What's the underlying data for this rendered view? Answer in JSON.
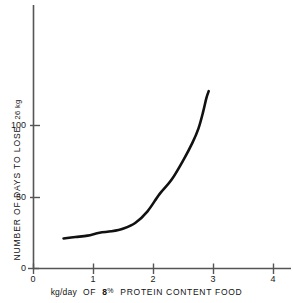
{
  "chart_data": {
    "type": "line",
    "title": "",
    "xlabel": "kg/day OF 8 % PROTEIN CONTENT FOOD",
    "ylabel": "NUMBER OF DAYS TO LOSE 26 kg",
    "xlabel_parts": {
      "lead": "kg/day",
      "mid": "OF",
      "value": "8",
      "percent": "%",
      "tail": "PROTEIN CONTENT FOOD"
    },
    "ylabel_parts": {
      "main": "NUMBER OF DAYS TO LOSE",
      "unit": "26 kg"
    },
    "xlim": [
      0,
      4.3
    ],
    "ylim": [
      0,
      145
    ],
    "xticks": [
      0,
      1,
      2,
      3,
      4
    ],
    "xtick_labels": [
      "0",
      "1",
      "2",
      "3",
      "4"
    ],
    "yticks": [
      0,
      50,
      100
    ],
    "ytick_labels": [
      "0",
      "50",
      "100"
    ],
    "grid": false,
    "legend": null,
    "series": [
      {
        "name": "days to lose 26 kg",
        "color": "#111111",
        "x": [
          0.5,
          0.7,
          0.9,
          1.1,
          1.3,
          1.5,
          1.7,
          1.9,
          2.1,
          2.3,
          2.5,
          2.65,
          2.75,
          2.83,
          2.88,
          2.92
        ],
        "values": [
          21,
          22,
          23,
          25,
          26,
          28,
          32,
          40,
          52,
          62,
          76,
          88,
          98,
          110,
          119,
          124
        ]
      }
    ],
    "axis_color": "#4d4d4d",
    "curve_color": "#111111"
  },
  "tick_positions": {
    "x": [
      {
        "label": "0",
        "px": 33
      },
      {
        "label": "1",
        "px": 93
      },
      {
        "label": "2",
        "px": 153
      },
      {
        "label": "3",
        "px": 213
      },
      {
        "label": "4",
        "px": 273
      }
    ],
    "y": [
      {
        "label": "0",
        "px": 268
      },
      {
        "label": "50",
        "px": 197
      },
      {
        "label": "100",
        "px": 125
      }
    ]
  }
}
